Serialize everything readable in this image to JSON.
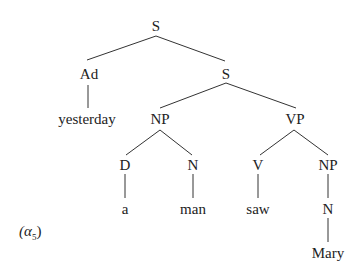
{
  "diagram": {
    "type": "syntax-tree",
    "label": {
      "prefix": "(",
      "symbol": "α",
      "subscript": "5",
      "suffix": ")"
    },
    "nodes": {
      "root": "S",
      "ad": "Ad",
      "s2": "S",
      "yesterday": "yesterday",
      "np1": "NP",
      "vp": "VP",
      "d": "D",
      "n1": "N",
      "v": "V",
      "np2": "NP",
      "a": "a",
      "man": "man",
      "saw": "saw",
      "n2": "N",
      "mary": "Mary"
    },
    "edges": [
      [
        "S",
        "Ad"
      ],
      [
        "S",
        "S"
      ],
      [
        "Ad",
        "yesterday"
      ],
      [
        "S",
        "NP"
      ],
      [
        "S",
        "VP"
      ],
      [
        "NP",
        "D"
      ],
      [
        "NP",
        "N"
      ],
      [
        "VP",
        "V"
      ],
      [
        "VP",
        "NP"
      ],
      [
        "D",
        "a"
      ],
      [
        "N",
        "man"
      ],
      [
        "V",
        "saw"
      ],
      [
        "NP",
        "N"
      ],
      [
        "N",
        "Mary"
      ]
    ],
    "line_color": "#333333"
  }
}
